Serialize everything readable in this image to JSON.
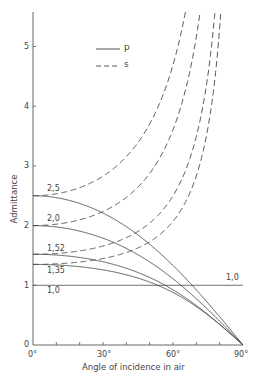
{
  "chart_data": {
    "type": "line",
    "title": "",
    "xlabel": "Angle of incidence in air",
    "ylabel": "Admittance",
    "xlim": [
      0,
      90
    ],
    "ylim": [
      0,
      5.6
    ],
    "x_ticks": [
      "0°",
      "30°",
      "60°",
      "90°"
    ],
    "y_ticks": [
      "0",
      "1",
      "2",
      "3",
      "4",
      "5"
    ],
    "grid": false,
    "legend": {
      "position": "upper-center",
      "entries": [
        {
          "label": "p",
          "style": "solid"
        },
        {
          "label": "s",
          "style": "dashed"
        }
      ]
    },
    "curve_labels": [
      "2,5",
      "2,0",
      "1,52",
      "1,35",
      "1,0"
    ],
    "right_label": "1,0",
    "x": [
      0,
      15,
      30,
      45,
      60,
      75,
      90
    ],
    "series": [
      {
        "name": "p, n=2.5",
        "n": 2.5,
        "pol": "p",
        "values": [
          2.5,
          2.428,
          2.21,
          1.843,
          1.333,
          0.702,
          0
        ]
      },
      {
        "name": "s, n=2.5",
        "n": 2.5,
        "pol": "s",
        "values": [
          2.5,
          2.574,
          2.828,
          3.391,
          4.69,
          null,
          null
        ]
      },
      {
        "name": "p, n=2.0",
        "n": 2.0,
        "pol": "p",
        "values": [
          2.0,
          1.948,
          1.789,
          1.512,
          1.109,
          0.591,
          0
        ]
      },
      {
        "name": "s, n=2.0",
        "n": 2.0,
        "pol": "s",
        "values": [
          2.0,
          2.053,
          2.236,
          2.646,
          3.606,
          null,
          null
        ]
      },
      {
        "name": "p, n=1.52",
        "n": 1.52,
        "pol": "p",
        "values": [
          1.52,
          1.49,
          1.394,
          1.214,
          0.925,
          0.509,
          0
        ]
      },
      {
        "name": "s, n=1.52",
        "n": 1.52,
        "pol": "s",
        "values": [
          1.52,
          1.551,
          1.657,
          1.903,
          2.498,
          4.535,
          null
        ]
      },
      {
        "name": "p, n=1.35",
        "n": 1.35,
        "pol": "p",
        "values": [
          1.35,
          1.329,
          1.259,
          1.121,
          0.88,
          0.5,
          0
        ]
      },
      {
        "name": "s, n=1.35",
        "n": 1.35,
        "pol": "s",
        "values": [
          1.35,
          1.372,
          1.448,
          1.626,
          2.071,
          3.644,
          null
        ]
      },
      {
        "name": "p = s, n=1.0",
        "n": 1.0,
        "pol": "both",
        "values": [
          1,
          1,
          1,
          1,
          1,
          1,
          1
        ]
      }
    ]
  },
  "axes": {
    "xlabel": "Angle of incidence in air",
    "ylabel": "Admittance",
    "x_ticks": [
      "0°",
      "30°",
      "60°",
      "90°"
    ],
    "y_ticks": [
      "0",
      "1",
      "2",
      "3",
      "4",
      "5"
    ]
  },
  "legend": {
    "p": "p",
    "s": "s"
  },
  "labels": {
    "n25": "2,5",
    "n20": "2,0",
    "n152": "1,52",
    "n135": "1,35",
    "n10": "1,0",
    "n10_right": "1,0"
  },
  "colors": {
    "line": "#444444",
    "axis": "#555555"
  }
}
